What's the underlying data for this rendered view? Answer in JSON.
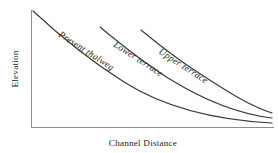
{
  "figure": {
    "background_color": "#ffffff",
    "axis_color": "#8d8d8d",
    "curve_color": "#3a3a3a",
    "text_color": "#262626"
  },
  "axes": {
    "y_label": "Elevation",
    "x_label": "Channel Distance"
  },
  "chart_data": {
    "type": "line",
    "title": "",
    "xlabel": "Channel Distance",
    "ylabel": "Elevation",
    "xlim": [
      0,
      100
    ],
    "ylim": [
      0,
      100
    ],
    "grid": false,
    "legend": "inline-curve-labels",
    "axis_ticks": {
      "x": [],
      "y": []
    },
    "annotations": [
      {
        "text": "Present thalweg",
        "on_series": "Present thalweg",
        "rotation_deg": 33
      },
      {
        "text": "Lower terrace",
        "on_series": "Lower terrace",
        "rotation_deg": 33
      },
      {
        "text": "Upper terrace",
        "on_series": "Upper terrace",
        "rotation_deg": 33
      }
    ],
    "series": [
      {
        "name": "Present thalweg",
        "label": "Present thalweg",
        "x": [
          1,
          10,
          20,
          30,
          40,
          50,
          60,
          70,
          80,
          90,
          100
        ],
        "y": [
          100,
          83,
          67,
          53,
          41,
          31,
          23,
          16,
          11,
          7,
          5
        ]
      },
      {
        "name": "Lower terrace",
        "label": "Lower terrace",
        "x": [
          29,
          36,
          45,
          55,
          65,
          75,
          85,
          92,
          100
        ],
        "y": [
          100,
          88,
          72,
          56,
          42,
          30,
          20,
          14,
          9
        ]
      },
      {
        "name": "Upper terrace",
        "label": "Upper terrace",
        "x": [
          45,
          52,
          60,
          70,
          80,
          88,
          94,
          100
        ],
        "y": [
          100,
          88,
          74,
          56,
          40,
          28,
          21,
          13
        ]
      }
    ]
  },
  "curves": [
    {
      "name": "present-thalweg",
      "label": "Present thalweg",
      "path": "M 33 11 C 60 36, 86 58, 124 82 C 165 108, 215 120, 272 123",
      "label_x": 58,
      "label_y": 36,
      "label_rotation": 33
    },
    {
      "name": "lower-terrace",
      "label": "Lower terrace",
      "path": "M 100 27 C 118 42, 140 60, 168 78 C 205 101, 238 114, 272 118",
      "label_x": 113,
      "label_y": 46,
      "label_rotation": 33
    },
    {
      "name": "upper-terrace",
      "label": "Upper terrace",
      "path": "M 141 30 C 158 44, 178 60, 202 75 C 228 92, 250 106, 272 113",
      "label_x": 158,
      "label_y": 53,
      "label_rotation": 33
    }
  ],
  "axis_geometry": {
    "y_axis_path": "M 31.5 10 L 31.5 128",
    "x_axis_path": "M 31 127.5 L 274 127.5"
  }
}
